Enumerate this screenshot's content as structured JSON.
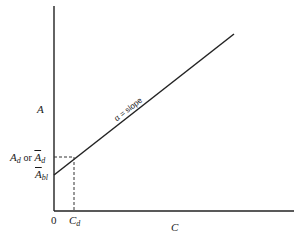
{
  "diagram": {
    "type": "linear-relationship",
    "y_axis_label": "A",
    "x_axis_label": "C",
    "origin_label": "0",
    "line_annotation": "α = slope",
    "y_marker_label_main": "A",
    "y_marker_label_sub": "d",
    "y_marker_or": "or",
    "y_marker_alt_main": "A",
    "y_marker_alt_sub": "d",
    "intercept_label_main": "A",
    "intercept_label_sub": "bl",
    "x_marker_label_main": "C",
    "x_marker_label_sub": "d",
    "colors": {
      "line": "#222222",
      "background": "#ffffff"
    }
  }
}
